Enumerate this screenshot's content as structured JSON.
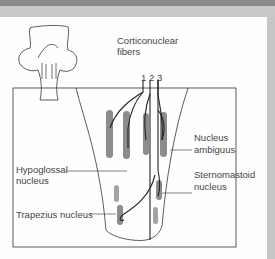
{
  "figure": {
    "labels": {
      "corticonuclear_line1": "Corticonuclear",
      "corticonuclear_line2": "fibers",
      "fiber_numbers": [
        "1",
        "2",
        "3"
      ],
      "nucleus_ambiguus_line1": "Nucleus",
      "nucleus_ambiguus_line2": "ambiguus",
      "hypoglossal_line1": "Hypoglossal",
      "hypoglossal_line2": "nucleus",
      "sternomastoid_line1": "Sternomastoid",
      "sternomastoid_line2": "nucleus",
      "trapezius": "Trapezius nucleus"
    },
    "colors": {
      "background": "#fefefe",
      "frame": "#b9b9b9",
      "nucleus_fill": "#8c8c8c",
      "line": "#333333",
      "text": "#444444"
    }
  }
}
